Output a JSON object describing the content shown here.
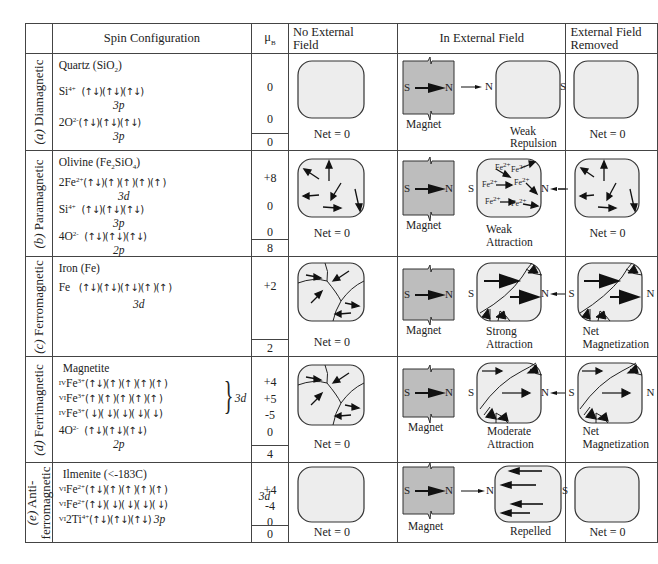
{
  "header": {
    "spin_configuration": "Spin Configuration",
    "mu_b": "μ",
    "mu_b_sub": "B",
    "no_external_field_line1": "No External",
    "no_external_field_line2": "Field",
    "in_external_field": "In External Field",
    "external_field_removed_line1": "External Field",
    "external_field_removed_line2": "Removed"
  },
  "rows": [
    {
      "id": "a",
      "label_letter": "(a)",
      "label_name": "Diamagnetic",
      "mineral": "Quartz (SiO",
      "mineral_sub": "2",
      "mineral_end": ")",
      "configs": [
        {
          "ion": "Si",
          "charge": "4+",
          "spins": "(↑↓)(↑↓)(↑↓)",
          "orbital": "3p",
          "mu": "0"
        },
        {
          "ion": "2O",
          "charge": "2-",
          "spins": "(↑↓)(↑↓)(↑↓)",
          "orbital": "3p",
          "mu": "0"
        }
      ],
      "total": "0",
      "no_field_caption": "Net = 0",
      "magnet_caption": "Magnet",
      "in_field_caption_1": "Weak",
      "in_field_caption_2": "Repulsion",
      "removed_caption_1": "Net = 0",
      "removed_caption_2": ""
    },
    {
      "id": "b",
      "label_letter": "(b)",
      "label_name": "Paramagnetic",
      "mineral": "Olivine (Fe",
      "mineral_sub": "2",
      "mineral_mid": "SiO",
      "mineral_sub2": "4",
      "mineral_end": ")",
      "configs": [
        {
          "ion": "2Fe",
          "charge": "2+",
          "spins": "(↑↓)(↑ )(↑ )(↑ )(↑ )",
          "orbital": "3d",
          "mu": "+8"
        },
        {
          "ion": "Si",
          "charge": "4+",
          "spins": "(↑↓)(↑↓)(↑↓)",
          "orbital": "3p",
          "mu": "0"
        },
        {
          "ion": "4O",
          "charge": "2-",
          "spins": "(↑↓)(↑↓)(↑↓)",
          "orbital": "2p",
          "mu": "0"
        }
      ],
      "total": "8",
      "no_field_caption": "Net = 0",
      "magnet_caption": "Magnet",
      "in_field_caption_1": "Weak",
      "in_field_caption_2": "Attraction",
      "removed_caption_1": "Net = 0",
      "removed_caption_2": "",
      "ion_label": "Fe",
      "ion_charge": "2+"
    },
    {
      "id": "c",
      "label_letter": "(c)",
      "label_name": "Ferromagnetic",
      "mineral": "Iron (Fe)",
      "configs": [
        {
          "ion": "Fe",
          "charge": "",
          "spins": "(↑↓)(↑↓)(↑↓)(↑ )(↑ )",
          "orbital": "3d",
          "mu": "+2"
        }
      ],
      "total": "2",
      "no_field_caption": "Net = 0",
      "magnet_caption": "Magnet",
      "in_field_caption_1": "Strong",
      "in_field_caption_2": "Attraction",
      "removed_caption_1": "Net",
      "removed_caption_2": "Magnetization"
    },
    {
      "id": "d",
      "label_letter": "(d)",
      "label_name": "Ferrimagnetic",
      "mineral": "Magnetite",
      "configs": [
        {
          "site": "IV",
          "ion": "Fe",
          "charge": "3+",
          "spins": "(↑↓)(↑ )(↑ )(↑ )(↑ )",
          "mu": "+4"
        },
        {
          "site": "VI",
          "ion": "Fe",
          "charge": "3+",
          "spins": "(↑ )(↑ )(↑ )(↑ )(↑ )",
          "mu": "+5"
        },
        {
          "site": "IV",
          "ion": "Fe",
          "charge": "3+",
          "spins": "( ↓)( ↓)( ↓)( ↓)( ↓)",
          "mu": "-5"
        },
        {
          "ion": "4O",
          "charge": "2-",
          "spins": "(↑↓)(↑↓)(↑↓)",
          "orbital": "2p",
          "mu": "0"
        }
      ],
      "group_orbital": "3d",
      "total": "4",
      "no_field_caption": "Net = 0",
      "magnet_caption": "Magnet",
      "in_field_caption_1": "Moderate",
      "in_field_caption_2": "Attraction",
      "removed_caption_1": "Net",
      "removed_caption_2": "Magnetization"
    },
    {
      "id": "e",
      "label_letter": "(e)",
      "label_name_1": "Anti-",
      "label_name_2": "ferromagnetic",
      "mineral": "Ilmenite (<-183C)",
      "configs": [
        {
          "site": "VI",
          "ion": "Fe",
          "charge": "2+",
          "spins": "(↑↓)(↑ )(↑ )(↑ )(↑ )",
          "mu": "+4"
        },
        {
          "site": "VI",
          "ion": "Fe",
          "charge": "2+",
          "spins": "(↑↓)( ↓)( ↓)( ↓)( ↓)",
          "mu": "-4"
        },
        {
          "site": "VI",
          "ion": "2Ti",
          "charge": "4+",
          "spins": "(↑↓)(↑↓)(↑↓)",
          "orbital": "3p",
          "mu": "0"
        }
      ],
      "group_orbital": "3d",
      "total": "0",
      "no_field_caption": "Net = 0",
      "magnet_caption": "Magnet",
      "in_field_caption_1": "Repelled",
      "in_field_caption_2": "",
      "removed_caption_1": "Net = 0",
      "removed_caption_2": ""
    }
  ],
  "pole_labels": {
    "north": "N",
    "south": "S"
  },
  "colors": {
    "border": "#444444",
    "sample_fill": "#ededed",
    "magnet_fill": "#bdbdbd",
    "arrow": "#111111"
  }
}
